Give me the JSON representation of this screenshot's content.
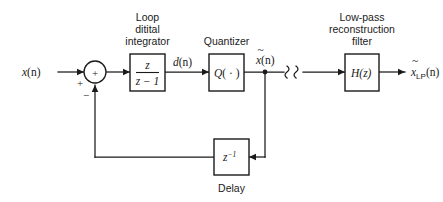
{
  "diagram": {
    "stroke_color": "#1a1a1a",
    "background_color": "#ffffff",
    "captions": {
      "integrator": [
        "Loop",
        "ditital",
        "integrator"
      ],
      "quantizer": "Quantizer",
      "filter": [
        "Low-pass",
        "reconstruction",
        "filter"
      ],
      "delay": "Delay"
    },
    "blocks": [
      {
        "id": "integrator",
        "kind": "fraction",
        "numerator": "z",
        "denominator": "z − 1"
      },
      {
        "id": "quantizer",
        "kind": "text",
        "label_italic": "Q",
        "label_rest": "( · )"
      },
      {
        "id": "delay",
        "kind": "power",
        "base": "z",
        "exponent": "−1"
      },
      {
        "id": "filter",
        "kind": "text",
        "label_italic": "H",
        "label_rest": "(z)"
      }
    ],
    "summing_junction": {
      "inner_sign": "+",
      "input_sign": "+",
      "feedback_sign": "−"
    },
    "signals": {
      "input": {
        "base": "x",
        "args": "(n)"
      },
      "integrator_output": {
        "base": "d",
        "args": "(n)"
      },
      "quantizer_output": {
        "base": "x",
        "tilde": true,
        "args": "(n)"
      },
      "filter_output": {
        "base": "x",
        "tilde": true,
        "subscript": "LP",
        "args": "(n)"
      }
    },
    "break_marker": "⌇⌇"
  }
}
